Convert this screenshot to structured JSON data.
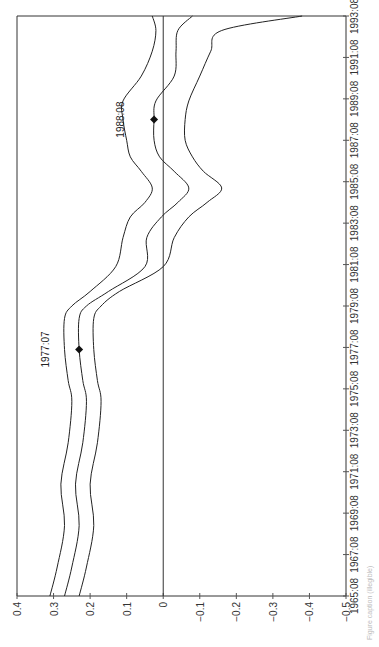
{
  "chart_data": {
    "type": "line",
    "orientation": "rotated-90-ccw",
    "title": "",
    "xlabel": "",
    "ylabel": "",
    "ylim": [
      -0.5,
      0.4
    ],
    "y_ticks": [
      0.4,
      0.3,
      0.2,
      0.1,
      0,
      -0.1,
      -0.2,
      -0.3,
      -0.4,
      -0.5
    ],
    "y_tick_labels": [
      "0.4",
      "0.3",
      "0.2",
      "0.1",
      "0",
      "−0.1",
      "−0.2",
      "−0.3",
      "−0.4",
      "−0.5"
    ],
    "x_tick_labels": [
      "1965:08",
      "1967:08",
      "1969:08",
      "1971:08",
      "1973:08",
      "1975:08",
      "1977:08",
      "1979:08",
      "1981:08",
      "1983:08",
      "1985:08",
      "1987:08",
      "1989:08",
      "1991:08",
      "1993:08"
    ],
    "x": [
      1965.6,
      1967.0,
      1969.0,
      1971.0,
      1973.0,
      1975.0,
      1976.0,
      1977.5,
      1979.0,
      1979.6,
      1980.3,
      1981.5,
      1982.9,
      1983.9,
      1984.6,
      1985.3,
      1986.1,
      1986.8,
      1987.6,
      1988.6,
      1989.5,
      1990.7,
      1991.9,
      1992.9,
      1993.6
    ],
    "series": [
      {
        "name": "upper band",
        "values": [
          0.31,
          0.29,
          0.27,
          0.28,
          0.26,
          0.25,
          0.26,
          0.27,
          0.27,
          0.25,
          0.2,
          0.13,
          0.11,
          0.09,
          0.05,
          0.03,
          0.06,
          0.09,
          0.1,
          0.11,
          0.11,
          0.06,
          0.03,
          0.02,
          0.03
        ]
      },
      {
        "name": "estimate",
        "values": [
          0.27,
          0.25,
          0.23,
          0.24,
          0.22,
          0.21,
          0.22,
          0.23,
          0.23,
          0.21,
          0.15,
          0.05,
          0.045,
          0.005,
          -0.04,
          -0.07,
          -0.03,
          0.01,
          0.025,
          0.025,
          0.02,
          -0.03,
          -0.035,
          -0.04,
          -0.08
        ]
      },
      {
        "name": "lower band",
        "values": [
          0.23,
          0.21,
          0.19,
          0.2,
          0.18,
          0.17,
          0.18,
          0.19,
          0.19,
          0.17,
          0.12,
          0.0,
          -0.03,
          -0.07,
          -0.12,
          -0.16,
          -0.11,
          -0.08,
          -0.06,
          -0.06,
          -0.07,
          -0.1,
          -0.13,
          -0.16,
          -0.38
        ]
      }
    ],
    "reference_line": {
      "value": 0
    },
    "annotations": [
      {
        "label": "1977:07",
        "x": 1977.5,
        "value": 0.23,
        "marker": "diamond"
      },
      {
        "label": "1988:08",
        "x": 1988.6,
        "value": 0.025,
        "marker": "diamond"
      }
    ],
    "grid": false,
    "legend": null
  },
  "caption": "Figure caption (illegible)"
}
